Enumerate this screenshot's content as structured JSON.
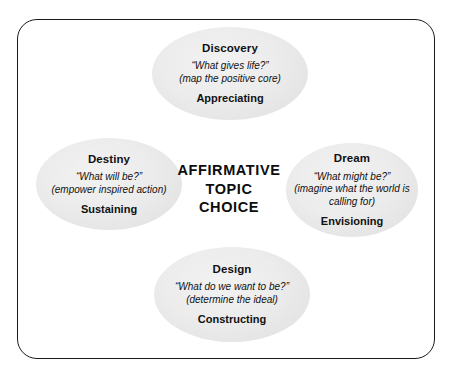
{
  "diagram": {
    "center": {
      "lines": [
        "AFFIRMATIVE",
        "TOPIC",
        "CHOICE"
      ]
    },
    "frame": {
      "border_color": "#1a1a1a",
      "background_color": "#ffffff"
    },
    "ellipse_fill_color": "#ececec",
    "nodes": [
      {
        "id": "discovery",
        "title": "Discovery",
        "question": "“What gives life?”",
        "detail": "(map the positive core)",
        "action": "Appreciating",
        "position": "top"
      },
      {
        "id": "destiny",
        "title": "Destiny",
        "question": "“What will be?”",
        "detail": "(empower inspired action)",
        "action": "Sustaining",
        "position": "left"
      },
      {
        "id": "dream",
        "title": "Dream",
        "question": "“What might be?”",
        "detail": "(imagine what the world is calling for)",
        "action": "Envisioning",
        "position": "right"
      },
      {
        "id": "design",
        "title": "Design",
        "question": "“What do we want to be?”",
        "detail": "(determine the ideal)",
        "action": "Constructing",
        "position": "bottom"
      }
    ]
  }
}
